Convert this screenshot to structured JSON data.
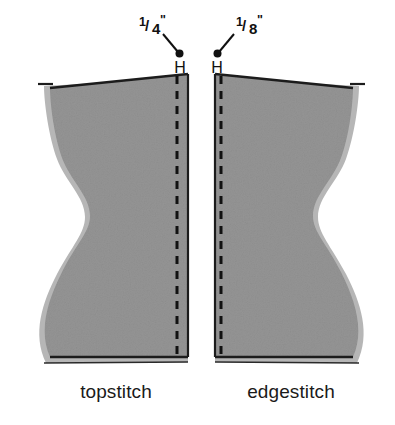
{
  "figure": {
    "background_color": "#ffffff",
    "fabric_fill": "#949494",
    "fabric_shadow": "#b4b4b4",
    "outline_color": "#1c1c1c",
    "stitch_color": "#111111"
  },
  "panels": [
    {
      "id": "topstitch",
      "caption": "topstitch",
      "dimension_numerator": "1",
      "dimension_denominator": "4",
      "dimension_unit": "\"",
      "dimension_label": "1/4\"",
      "hmark": "H",
      "stitch_style": "dashed",
      "stitch_side": "right"
    },
    {
      "id": "edgestitch",
      "caption": "edgestitch",
      "dimension_numerator": "1",
      "dimension_denominator": "8",
      "dimension_unit": "\"",
      "dimension_label": "1/8\"",
      "hmark": "H",
      "stitch_style": "dashed",
      "stitch_side": "left"
    }
  ],
  "annotations": {
    "leader_left_label": "1/4\"",
    "leader_right_label": "1/8\""
  }
}
